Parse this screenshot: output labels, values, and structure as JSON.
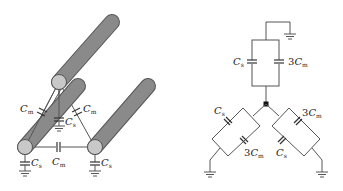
{
  "figure": {
    "left_panel": {
      "description": "Three-conductor cable with mutual and self capacitances",
      "conductors": 3,
      "labels": {
        "mutual_left": {
          "main": "C",
          "sub": "m"
        },
        "mutual_right": {
          "main": "C",
          "sub": "m"
        },
        "mutual_bottom": {
          "main": "C",
          "sub": "m"
        },
        "self_center": {
          "main": "C",
          "sub": "s"
        },
        "self_left": {
          "main": "C",
          "sub": "s"
        },
        "self_right": {
          "main": "C",
          "sub": "s"
        }
      }
    },
    "right_panel": {
      "description": "Equivalent star network of capacitances to ground",
      "labels": {
        "top_cs": {
          "main": "C",
          "sub": "s"
        },
        "top_cm": {
          "coef": "3",
          "main": "C",
          "sub": "m"
        },
        "left_cs": {
          "main": "C",
          "sub": "s"
        },
        "left_cm": {
          "coef": "3",
          "main": "C",
          "sub": "m"
        },
        "right_cm": {
          "coef": "3",
          "main": "C",
          "sub": "m"
        },
        "right_cs": {
          "main": "C",
          "sub": "s"
        }
      }
    },
    "colors": {
      "cylinder_body": "#8a8a8a",
      "cylinder_outline": "#555555",
      "cylinder_cap": "#c8c8c8",
      "wire": "#555555",
      "node": "#111111"
    }
  }
}
